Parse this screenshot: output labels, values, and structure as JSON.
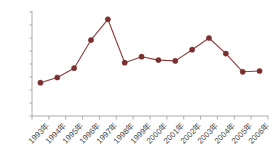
{
  "chart_data": {
    "type": "line",
    "title": "",
    "subtitle": "",
    "xlabel": "",
    "ylabel": "",
    "categories": [
      "1993年",
      "1994年",
      "1995年",
      "1996年",
      "1997年",
      "1998年",
      "1999年",
      "2000年",
      "2001年",
      "2002年",
      "2003年",
      "2004年",
      "2005年",
      "2006年"
    ],
    "values": [
      1280,
      1480,
      1840,
      2920,
      3720,
      2050,
      2280,
      2150,
      2120,
      2550,
      3000,
      2400,
      1700,
      1730
    ],
    "series": [
      {
        "name": "series-1",
        "values": [
          1280,
          1480,
          1840,
          2920,
          3720,
          2050,
          2280,
          2150,
          2120,
          2550,
          3000,
          2400,
          1700,
          1730
        ]
      }
    ],
    "ylim": [
      0,
      4000
    ],
    "yticks": [
      0,
      500,
      1000,
      1500,
      2000,
      2500,
      3000,
      3500,
      4000
    ],
    "ytick_labels": [
      "0",
      "500",
      "1000",
      "1500",
      "2000",
      "2500",
      "3000",
      "3500",
      "4000"
    ],
    "grid": false,
    "legend": "none",
    "marker": "circle",
    "colors": {
      "line": "#8B3E3E",
      "marker": "#7B2E2E",
      "axis": "#9a9a9a",
      "tick_text": "#4a4a4a",
      "background": "#ffffff"
    }
  }
}
